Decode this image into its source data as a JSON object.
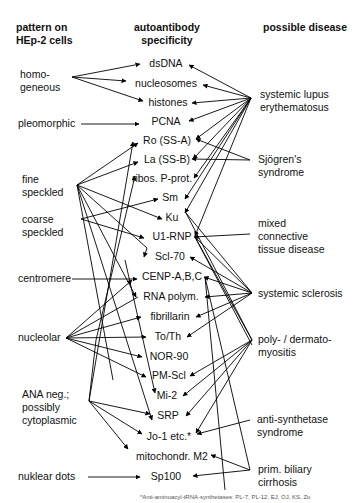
{
  "headers": {
    "pattern": "pattern on\nHEp-2 cells",
    "antibody": "autoantibody\nspecificity",
    "disease": "possible disease"
  },
  "patterns": [
    {
      "id": "homogeneous",
      "label": "homo-\ngeneous",
      "x": 20,
      "y": 68
    },
    {
      "id": "pleomorphic",
      "label": "pleomorphic",
      "x": 18,
      "y": 117
    },
    {
      "id": "fine",
      "label": "fine\nspeckled",
      "x": 22,
      "y": 173
    },
    {
      "id": "coarse",
      "label": "coarse\nspeckled",
      "x": 22,
      "y": 213
    },
    {
      "id": "centromere",
      "label": "centromere",
      "x": 18,
      "y": 272
    },
    {
      "id": "nucleolar",
      "label": "nucleolar",
      "x": 18,
      "y": 337
    },
    {
      "id": "ananeg",
      "label": "ANA neg.;\npossibly\ncytoplasmic",
      "x": 22,
      "y": 388
    },
    {
      "id": "dots",
      "label": "nuklear dots",
      "x": 18,
      "y": 470
    }
  ],
  "antibodies": [
    {
      "id": "dsDNA",
      "label": "dsDNA",
      "x": 163,
      "y": 57
    },
    {
      "id": "nucleosomes",
      "label": "nucleosomes",
      "x": 166,
      "y": 77
    },
    {
      "id": "histones",
      "label": "histones",
      "x": 168,
      "y": 96
    },
    {
      "id": "PCNA",
      "label": "PCNA",
      "x": 166,
      "y": 115
    },
    {
      "id": "Ro",
      "label": "Ro (SS-A)",
      "x": 167,
      "y": 134
    },
    {
      "id": "La",
      "label": "La (SS-B)",
      "x": 167,
      "y": 153
    },
    {
      "id": "ribos",
      "label": "ribos. P-prot.",
      "x": 162,
      "y": 172
    },
    {
      "id": "Sm",
      "label": "Sm",
      "x": 167,
      "y": 191
    },
    {
      "id": "Ku",
      "label": "Ku",
      "x": 167,
      "y": 211
    },
    {
      "id": "U1RNP",
      "label": "U1-RNP",
      "x": 170,
      "y": 230
    },
    {
      "id": "Scl70",
      "label": "Scl-70",
      "x": 170,
      "y": 250
    },
    {
      "id": "CENP",
      "label": "CENP-A,B,C",
      "x": 174,
      "y": 270
    },
    {
      "id": "RNApol",
      "label": "RNA polym.",
      "x": 172,
      "y": 290
    },
    {
      "id": "fibrillarin",
      "label": "fibrillarin",
      "x": 170,
      "y": 310
    },
    {
      "id": "ToTh",
      "label": "To/Th",
      "x": 167,
      "y": 330
    },
    {
      "id": "NOR90",
      "label": "NOR-90",
      "x": 169,
      "y": 350
    },
    {
      "id": "PMScl",
      "label": "PM-Scl",
      "x": 168,
      "y": 369
    },
    {
      "id": "Mi2",
      "label": "Mi-2",
      "x": 166,
      "y": 389
    },
    {
      "id": "SRP",
      "label": "SRP",
      "x": 168,
      "y": 409
    },
    {
      "id": "Jo1",
      "label": "Jo-1 etc.*",
      "x": 170,
      "y": 430
    },
    {
      "id": "mito",
      "label": "mitochondr. M2",
      "x": 172,
      "y": 450
    },
    {
      "id": "Sp100",
      "label": "Sp100",
      "x": 166,
      "y": 470
    }
  ],
  "diseases": [
    {
      "id": "SLE",
      "label": "systemic lupus\nerythematosus",
      "x": 260,
      "y": 88
    },
    {
      "id": "sjogren",
      "label": "Sjögren's\nsyndrome",
      "x": 258,
      "y": 153
    },
    {
      "id": "mctd",
      "label": "mixed\nconnective\ntissue disease",
      "x": 258,
      "y": 217
    },
    {
      "id": "ssc",
      "label": "systemic sclerosis",
      "x": 258,
      "y": 290
    },
    {
      "id": "pm",
      "label": "poly- / dermato-\nmyositis",
      "x": 258,
      "y": 330
    },
    {
      "id": "antisyn",
      "label": "anti-synthetase\nsyndrome",
      "x": 257,
      "y": 413
    },
    {
      "id": "pbc",
      "label": "prim. biliary\ncirrhosis",
      "x": 258,
      "y": 463
    }
  ],
  "footnote": "*Anti-aminoacyl-tRNA-synthetases: PL-7, PL-12, EJ, OJ, KS, Zo",
  "line_color": "#000000"
}
